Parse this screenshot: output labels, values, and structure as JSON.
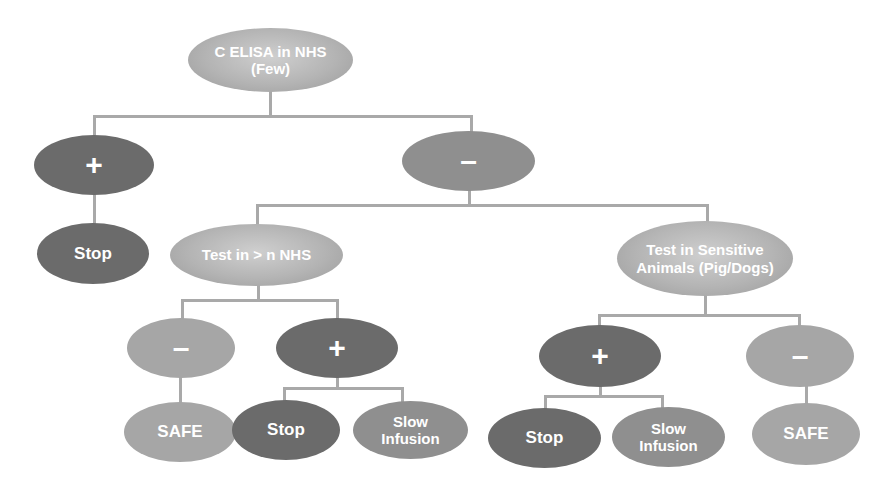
{
  "diagram": {
    "type": "decision-tree",
    "colors": {
      "connector": "#a9a9a9",
      "dark_node": "#6b6b6b",
      "mid_node": "#8f8f8f",
      "pale_node": "#a6a6a6",
      "gradient_node": "#b4b4b4",
      "text": "#ffffff"
    },
    "root": {
      "line1": "C ELISA in NHS",
      "line2": "(Few)"
    },
    "level1": {
      "positive": {
        "symbol": "+",
        "outcome": "Stop"
      },
      "negative": {
        "symbol": "–"
      }
    },
    "level2": {
      "nhs_test": {
        "label": "Test in > n NHS"
      },
      "animal_test": {
        "line1": "Test in Sensitive",
        "line2": "Animals (Pig/Dogs)"
      }
    },
    "level3": {
      "nhs_negative": {
        "symbol": "–",
        "outcome": "SAFE"
      },
      "nhs_positive": {
        "symbol": "+",
        "outcome_stop": "Stop",
        "outcome_slow_line1": "Slow",
        "outcome_slow_line2": "Infusion"
      },
      "animal_positive": {
        "symbol": "+",
        "outcome_stop": "Stop",
        "outcome_slow_line1": "Slow",
        "outcome_slow_line2": "Infusion"
      },
      "animal_negative": {
        "symbol": "–",
        "outcome": "SAFE"
      }
    }
  }
}
